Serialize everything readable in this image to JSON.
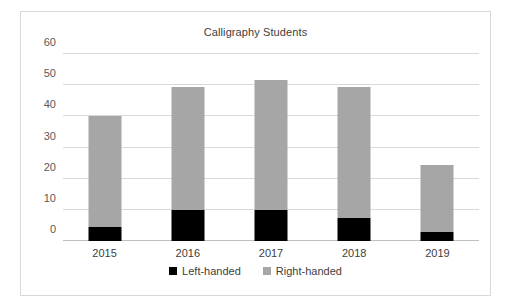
{
  "chart_data": {
    "type": "bar",
    "subtype": "stacked-column",
    "title": "Calligraphy Students",
    "xlabel": "",
    "ylabel": "",
    "categories": [
      "2015",
      "2016",
      "2017",
      "2018",
      "2019"
    ],
    "series": [
      {
        "name": "Left-handed",
        "color": "#000000",
        "values": [
          4.5,
          9.9,
          9.9,
          7.5,
          2.9
        ]
      },
      {
        "name": "Right-handed",
        "color": "#a6a6a6",
        "values": [
          35.5,
          39.6,
          41.9,
          42.0,
          21.5
        ]
      }
    ],
    "totals": [
      40,
      49.5,
      51.8,
      49.5,
      24.4
    ],
    "ylim": [
      0,
      60
    ],
    "yticks": [
      0,
      10,
      20,
      30,
      40,
      50,
      60
    ],
    "ytick_labels": [
      "0",
      "10",
      "20",
      "30",
      "40",
      "50",
      "60"
    ],
    "grid": true,
    "legend_position": "bottom",
    "legend": [
      "Left-handed",
      "Right-handed"
    ]
  },
  "style": {
    "plot_background": "#ffffff",
    "border_color": "#d9d9d9",
    "gridline_color": "#d9d9d9",
    "axis_color": "#bfbfbf",
    "title_color": "#404040",
    "tick_color": "#595959"
  }
}
